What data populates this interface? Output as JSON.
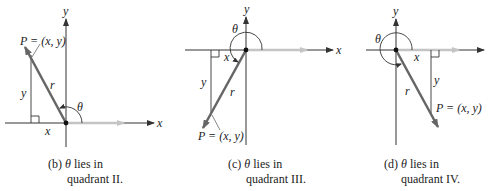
{
  "figures": [
    {
      "id": "b",
      "caption_line1_prefix": "(b) ",
      "caption_theta": "θ",
      "caption_line1_suffix": " lies in",
      "caption_line2": "quadrant II.",
      "point_label": "P = (x, y)",
      "labels": {
        "x_axis": "x",
        "y_axis": "y",
        "x_leg": "x",
        "y_leg": "y",
        "r": "r",
        "theta": "θ"
      }
    },
    {
      "id": "c",
      "caption_line1_prefix": "(c) ",
      "caption_theta": "θ",
      "caption_line1_suffix": " lies in",
      "caption_line2": "quadrant III.",
      "point_label": "P = (x, y)",
      "labels": {
        "x_axis": "x",
        "y_axis": "y",
        "x_leg": "x",
        "y_leg": "y",
        "r": "r",
        "theta": "θ"
      }
    },
    {
      "id": "d",
      "caption_line1_prefix": "(d) ",
      "caption_theta": "θ",
      "caption_line1_suffix": " lies in",
      "caption_line2": "quadrant IV.",
      "point_label": "P = (x, y)",
      "labels": {
        "x_axis": "x",
        "y_axis": "y",
        "x_leg": "x",
        "y_leg": "y",
        "r": "r",
        "theta": "θ"
      }
    }
  ],
  "colors": {
    "axis": "#333333",
    "terminal_side": "#666666",
    "initial_side": "#b8b8b8",
    "text": "#222222"
  }
}
